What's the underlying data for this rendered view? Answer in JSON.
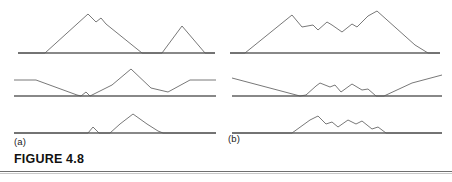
{
  "figure": {
    "caption": "FIGURE 4.8",
    "panel_labels": [
      {
        "id": "a",
        "text": "(a)"
      },
      {
        "id": "b",
        "text": "(b)"
      }
    ],
    "style": {
      "trace_color": "#555555",
      "baseline_color": "#888888",
      "rule_color": "#6f6f6f",
      "background": "#ffffff",
      "trace_width": 0.8,
      "baseline_width": 1.1
    }
  },
  "chart_data": {
    "type": "line",
    "title": "FIGURE 4.8",
    "xlabel": "",
    "ylabel": "",
    "grid": false,
    "legend": false,
    "panels": [
      {
        "id": "a1",
        "column": "a",
        "row": 1,
        "baseline_y": 53,
        "x_range": [
          18,
          215
        ],
        "y_range": [
          10,
          53
        ],
        "points": [
          [
            18,
            53
          ],
          [
            45,
            53
          ],
          [
            88,
            14
          ],
          [
            96,
            22
          ],
          [
            101,
            18
          ],
          [
            106,
            24
          ],
          [
            142,
            53
          ],
          [
            162,
            53
          ],
          [
            182,
            26
          ],
          [
            205,
            53
          ],
          [
            215,
            53
          ]
        ]
      },
      {
        "id": "a2",
        "column": "a",
        "row": 2,
        "baseline_y": 96,
        "x_range": [
          14,
          216
        ],
        "y_range": [
          69,
          96
        ],
        "points": [
          [
            14,
            80
          ],
          [
            36,
            80
          ],
          [
            77,
            95
          ],
          [
            81,
            96
          ],
          [
            86,
            92
          ],
          [
            90,
            96
          ],
          [
            112,
            85
          ],
          [
            131,
            69
          ],
          [
            151,
            88
          ],
          [
            168,
            92
          ],
          [
            190,
            80
          ],
          [
            216,
            80
          ]
        ]
      },
      {
        "id": "a3",
        "column": "a",
        "row": 3,
        "baseline_y": 133,
        "x_range": [
          14,
          216
        ],
        "y_range": [
          114,
          133
        ],
        "points": [
          [
            14,
            133
          ],
          [
            88,
            133
          ],
          [
            93,
            127
          ],
          [
            99,
            133
          ],
          [
            110,
            133
          ],
          [
            120,
            124
          ],
          [
            133,
            114
          ],
          [
            147,
            124
          ],
          [
            158,
            131
          ],
          [
            163,
            133
          ],
          [
            216,
            133
          ]
        ]
      },
      {
        "id": "b1",
        "column": "b",
        "row": 1,
        "baseline_y": 53,
        "x_range": [
          230,
          440
        ],
        "y_range": [
          11,
          53
        ],
        "points": [
          [
            230,
            53
          ],
          [
            245,
            53
          ],
          [
            292,
            15
          ],
          [
            302,
            27
          ],
          [
            313,
            25
          ],
          [
            318,
            30
          ],
          [
            327,
            22
          ],
          [
            332,
            25
          ],
          [
            342,
            32
          ],
          [
            352,
            24
          ],
          [
            357,
            27
          ],
          [
            368,
            16
          ],
          [
            377,
            11
          ],
          [
            415,
            45
          ],
          [
            428,
            53
          ],
          [
            440,
            53
          ]
        ]
      },
      {
        "id": "b2",
        "column": "b",
        "row": 2,
        "baseline_y": 96,
        "x_range": [
          232,
          442
        ],
        "y_range": [
          73,
          96
        ],
        "points": [
          [
            232,
            78
          ],
          [
            300,
            96
          ],
          [
            306,
            95
          ],
          [
            316,
            86
          ],
          [
            320,
            83
          ],
          [
            330,
            87
          ],
          [
            335,
            85
          ],
          [
            341,
            92
          ],
          [
            352,
            84
          ],
          [
            362,
            90
          ],
          [
            368,
            89
          ],
          [
            376,
            96
          ],
          [
            384,
            96
          ],
          [
            412,
            83
          ],
          [
            442,
            75
          ]
        ]
      },
      {
        "id": "b3",
        "column": "b",
        "row": 3,
        "baseline_y": 133,
        "x_range": [
          232,
          442
        ],
        "y_range": [
          116,
          133
        ],
        "points": [
          [
            232,
            133
          ],
          [
            292,
            133
          ],
          [
            310,
            120
          ],
          [
            318,
            116
          ],
          [
            326,
            124
          ],
          [
            332,
            122
          ],
          [
            338,
            127
          ],
          [
            348,
            120
          ],
          [
            356,
            124
          ],
          [
            362,
            121
          ],
          [
            372,
            129
          ],
          [
            378,
            127
          ],
          [
            386,
            133
          ],
          [
            442,
            133
          ]
        ]
      }
    ]
  }
}
